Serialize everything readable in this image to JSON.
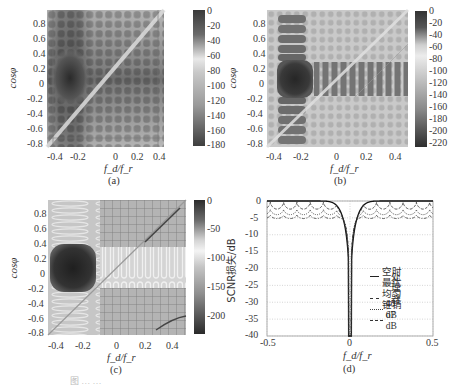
{
  "figure": {
    "caption_partial": "图 … …"
  },
  "chart_data": [
    {
      "panel": "a",
      "type": "heatmap",
      "label": "(a)",
      "xlabel": "f_d/f_r",
      "ylabel": "cosφ",
      "xlim": [
        -0.5,
        0.5
      ],
      "ylim": [
        -1,
        1
      ],
      "xticks": [
        "-0.4",
        "-0.2",
        "0",
        "0.2",
        "0.4"
      ],
      "yticks": [
        "0.8",
        "0.6",
        "0.4",
        "0.2",
        "0",
        "-0.2",
        "-0.4",
        "-0.6",
        "-0.8"
      ],
      "colorbar": {
        "ticks": [
          "0",
          "-20",
          "-40",
          "-60",
          "-80",
          "-100",
          "-120",
          "-140",
          "-160",
          "-180"
        ],
        "range": [
          -185,
          0
        ]
      },
      "features": {
        "main_lobe": {
          "fd": -0.3,
          "cos": 0
        },
        "clutter_ridge": "diagonal",
        "pattern": "grid sidelobes"
      }
    },
    {
      "panel": "b",
      "type": "heatmap",
      "label": "(b)",
      "xlabel": "f_d/f_r",
      "ylabel": "cosφ",
      "xlim": [
        -0.5,
        0.5
      ],
      "ylim": [
        -1,
        1
      ],
      "xticks": [
        "-0.4",
        "-0.2",
        "0",
        "0.2",
        "0.4"
      ],
      "yticks": [
        "0.8",
        "0.6",
        "0.4",
        "0.2",
        "0",
        "-0.2",
        "-0.4",
        "-0.6",
        "-0.8"
      ],
      "colorbar": {
        "ticks": [
          "0",
          "-20",
          "-40",
          "-60",
          "-80",
          "-100",
          "-120",
          "-140",
          "-160",
          "-180",
          "-200",
          "-220"
        ],
        "range": [
          -230,
          0
        ]
      },
      "features": {
        "main_lobe": {
          "fd": -0.3,
          "cos": 0
        },
        "clutter_ridge": "diagonal",
        "pattern": "tapered sidelobes"
      }
    },
    {
      "panel": "c",
      "type": "heatmap",
      "label": "(c)",
      "xlabel": "f_d/f_r",
      "ylabel": "cosφ",
      "xlim": [
        -0.5,
        0.5
      ],
      "ylim": [
        -1,
        1
      ],
      "xticks": [
        "-0.4",
        "-0.2",
        "0",
        "0.2",
        "0.4"
      ],
      "yticks": [
        "0.8",
        "0.6",
        "0.4",
        "0.2",
        "0",
        "-0.2",
        "-0.4",
        "-0.6",
        "-0.8"
      ],
      "colorbar": {
        "ticks": [
          "0",
          "-50",
          "-100",
          "-150",
          "-200"
        ],
        "range": [
          -240,
          0
        ]
      },
      "features": {
        "main_lobe": {
          "fd": -0.3,
          "cos": 0
        },
        "clutter_ridge": "diagonal",
        "pattern": "low sidelobes"
      }
    },
    {
      "panel": "d",
      "type": "line",
      "label": "(d)",
      "xlabel": "f_d/f_r",
      "ylabel": "SCNR损失/dB",
      "xlim": [
        -0.5,
        0.5
      ],
      "ylim": [
        -40,
        0
      ],
      "xticks": [
        "-0.5",
        "0",
        "0.5"
      ],
      "yticks": [
        "0",
        "-5",
        "-10",
        "-15",
        "-20",
        "-25",
        "-30",
        "-35",
        "-40"
      ],
      "grid": true,
      "legend_position": "lower right",
      "series": [
        {
          "name": "空时最优处理器",
          "style": "solid",
          "baseline": 0,
          "ripple": 0,
          "notch_width": 0.07
        },
        {
          "name": "均匀锥销",
          "style": "dashed",
          "baseline": -1.0,
          "ripple": 2.0,
          "notch_width": 0.06
        },
        {
          "name": "40 dB",
          "style": "dotted",
          "baseline": -3.0,
          "ripple": 1.5,
          "notch_width": 0.055
        },
        {
          "name": "67 dB",
          "style": "dashdot",
          "baseline": -4.5,
          "ripple": 1.0,
          "notch_width": 0.05
        }
      ]
    }
  ],
  "legend": {
    "items": [
      {
        "label_line1": "空时最优",
        "label_line2": "处理器"
      },
      {
        "label_line1": "均匀锥销"
      },
      {
        "label_line1": "40 dB"
      },
      {
        "label_line1": "67 dB"
      }
    ]
  }
}
